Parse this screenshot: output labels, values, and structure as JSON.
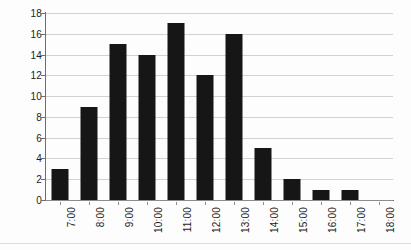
{
  "chart_data": {
    "type": "bar",
    "title": "",
    "subtitle": "",
    "xlabel": "",
    "ylabel": "",
    "categories": [
      "7:00",
      "8:00",
      "9:00",
      "10:00",
      "11:00",
      "12:00",
      "13:00",
      "14:00",
      "15:00",
      "16:00",
      "17:00",
      "18:00"
    ],
    "values": [
      3,
      9,
      15,
      14,
      17,
      12,
      16,
      5,
      2,
      1,
      1,
      0
    ],
    "series": [
      {
        "name": "",
        "values": [
          3,
          9,
          15,
          14,
          17,
          12,
          16,
          5,
          2,
          1,
          1,
          0
        ]
      }
    ],
    "ylim": [
      0,
      18
    ],
    "ytick_labels": [
      "0",
      "2",
      "4",
      "6",
      "8",
      "10",
      "12",
      "14",
      "16",
      "18"
    ],
    "ytick_values": [
      0,
      2,
      4,
      6,
      8,
      10,
      12,
      14,
      16,
      18
    ],
    "xtick_labels": [
      "7:00",
      "8:00",
      "9:00",
      "10:00",
      "11:00",
      "12:00",
      "13:00",
      "14:00",
      "15:00",
      "16:00",
      "17:00",
      "18:00"
    ],
    "xtick_rotation": -90,
    "grid": true,
    "grid_axis": "y",
    "legend": false,
    "legend_position": "none",
    "annotations": [],
    "bar_color": "#161616",
    "gridline_color": "#d2d2d2",
    "axis_color": "#6e6e6e",
    "background_color": "#fdfdfd"
  }
}
